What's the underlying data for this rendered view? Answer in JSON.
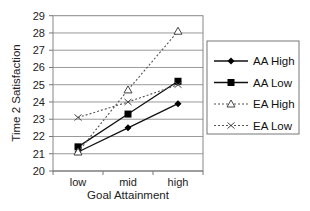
{
  "chart_data": {
    "type": "line",
    "title": "",
    "xlabel": "Goal Attainment",
    "ylabel": "Time 2 Satisfaction",
    "categories": [
      "low",
      "mid",
      "high"
    ],
    "ylim": [
      20,
      29
    ],
    "yticks": [
      20,
      21,
      22,
      23,
      24,
      25,
      26,
      27,
      28,
      29
    ],
    "grid": true,
    "legend_position": "right",
    "series": [
      {
        "name": "AA High",
        "values": [
          21.1,
          22.5,
          23.9
        ],
        "marker": "diamond",
        "line": "solid"
      },
      {
        "name": "AA Low",
        "values": [
          21.4,
          23.3,
          25.2
        ],
        "marker": "square",
        "line": "solid"
      },
      {
        "name": "EA High",
        "values": [
          21.1,
          24.7,
          28.1
        ],
        "marker": "triangle-open",
        "line": "dotted"
      },
      {
        "name": "EA Low",
        "values": [
          23.1,
          24.0,
          25.0
        ],
        "marker": "x",
        "line": "dotted"
      }
    ]
  }
}
